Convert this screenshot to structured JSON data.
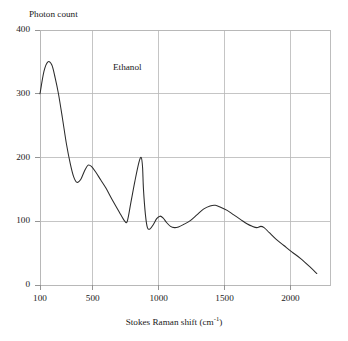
{
  "chart_data": {
    "type": "line",
    "title": "",
    "annotation": "Ethanol",
    "xlabel_main": "Stokes Raman shift (cm",
    "xlabel_sup": "-1",
    "xlabel_tail": ")",
    "xlabel_full": "Stokes Raman shift (cm-1)",
    "ylabel": "Photon count",
    "xlim": [
      100,
      2300
    ],
    "ylim": [
      0,
      400
    ],
    "grid": true,
    "legend": "none",
    "xticks": [
      100,
      500,
      1000,
      1500,
      2000
    ],
    "xtick_labels": [
      "100",
      "500",
      "1000",
      "1500",
      "2000"
    ],
    "yticks": [
      0,
      100,
      200,
      300,
      400
    ],
    "ytick_labels": [
      "0",
      "100",
      "200",
      "300",
      "400"
    ],
    "series": [
      {
        "name": "Ethanol",
        "color": "#2b2b2b",
        "x": [
          100,
          130,
          160,
          190,
          215,
          240,
          270,
          300,
          330,
          355,
          380,
          410,
          440,
          465,
          490,
          520,
          560,
          600,
          650,
          700,
          740,
          762,
          790,
          820,
          850,
          868,
          878,
          885,
          900,
          915,
          935,
          960,
          985,
          1010,
          1035,
          1060,
          1090,
          1120,
          1150,
          1190,
          1240,
          1290,
          1340,
          1390,
          1430,
          1470,
          1520,
          1570,
          1620,
          1670,
          1710,
          1745,
          1775,
          1800,
          1840,
          1890,
          1950,
          2010,
          2080,
          2150,
          2200
        ],
        "y": [
          300,
          335,
          350,
          345,
          325,
          300,
          262,
          222,
          190,
          170,
          161,
          166,
          180,
          188,
          186,
          178,
          165,
          152,
          133,
          115,
          101,
          100,
          130,
          163,
          192,
          200,
          185,
          150,
          110,
          90,
          88,
          95,
          104,
          108,
          105,
          98,
          92,
          90,
          91,
          95,
          101,
          110,
          119,
          124,
          125,
          122,
          117,
          110,
          103,
          96,
          92,
          90,
          92,
          90,
          82,
          72,
          62,
          52,
          41,
          28,
          18
        ]
      }
    ]
  },
  "axes": {
    "frame_color": "#b6b6b6",
    "grid_color": "#b6b6b6",
    "tick_color": "#8a8a8a",
    "text_color": "#1a1a1a"
  }
}
